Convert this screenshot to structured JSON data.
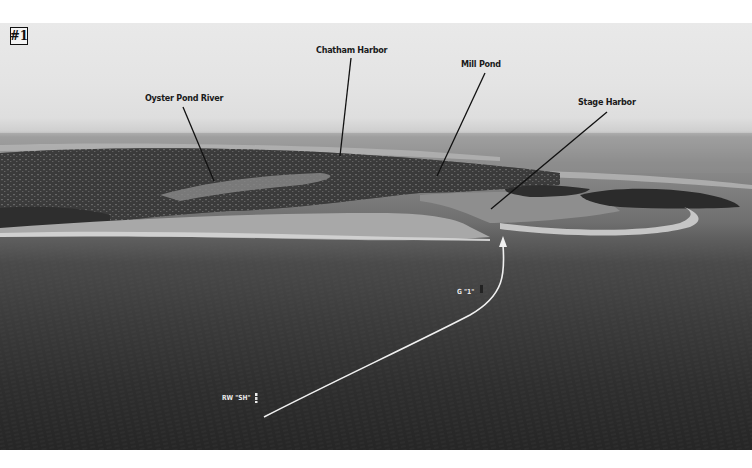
{
  "figure": {
    "badge": "#1"
  },
  "callouts": [
    {
      "id": "oyster-pond-river",
      "label": "Oyster Pond River"
    },
    {
      "id": "chatham-harbor",
      "label": "Chatham Harbor"
    },
    {
      "id": "mill-pond",
      "label": "Mill Pond"
    },
    {
      "id": "stage-harbor",
      "label": "Stage Harbor"
    }
  ],
  "navigation": {
    "start_buoy": "RW \"SH\"",
    "channel_marker": "G \"1\"",
    "course_line_color": "#f0f0f0"
  },
  "colors": {
    "leader_line": "#111111",
    "label_text": "#1a1a1a",
    "background": "#ffffff"
  }
}
